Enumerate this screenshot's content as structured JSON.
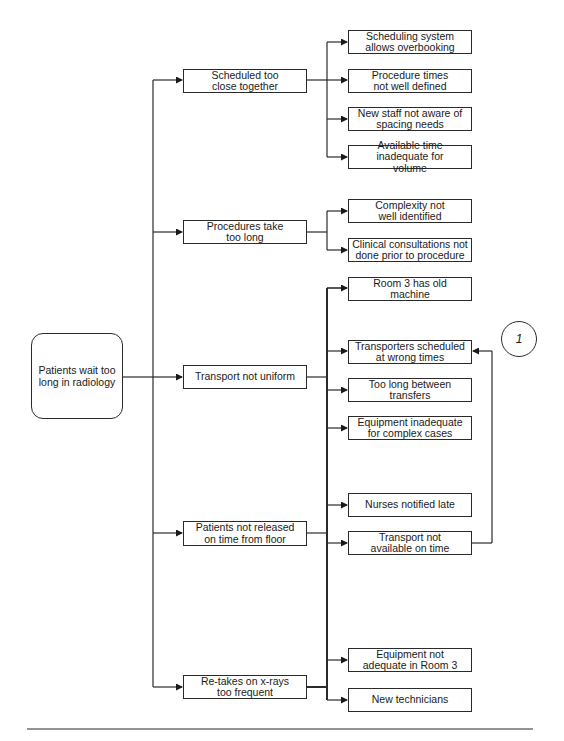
{
  "diagram": {
    "type": "tree-diagram",
    "root": {
      "label": "Patients wait too long in radiology",
      "lines": [
        "Patients wait too",
        "long in radiology"
      ]
    },
    "causes": [
      {
        "id": "c1",
        "lines": [
          "Scheduled too",
          "close together"
        ],
        "subcauses": [
          {
            "lines": [
              "Scheduling system",
              "allows overbooking"
            ]
          },
          {
            "lines": [
              "Procedure times",
              "not well defined"
            ]
          },
          {
            "lines": [
              "New staff not aware",
              "of spacing needs"
            ]
          },
          {
            "lines": [
              "Available time",
              "inadequate for volume"
            ]
          }
        ]
      },
      {
        "id": "c2",
        "lines": [
          "Procedures take",
          "too long"
        ],
        "subcauses": [
          {
            "lines": [
              "Complexity not",
              "well identified"
            ]
          },
          {
            "lines": [
              "Clinical consultations not",
              "done prior to procedure"
            ]
          },
          {
            "lines": [
              "Room 3 has old machine"
            ]
          }
        ]
      },
      {
        "id": "c3",
        "lines": [
          "Transport not uniform"
        ],
        "subcauses": [
          {
            "lines": [
              "Transporters scheduled",
              "at wrong times"
            ]
          },
          {
            "lines": [
              "Too long",
              "between transfers"
            ]
          },
          {
            "lines": [
              "Equipment inadequate",
              "for complex cases"
            ]
          }
        ]
      },
      {
        "id": "c4",
        "lines": [
          "Patients not released",
          "on time from floor"
        ],
        "subcauses": [
          {
            "lines": [
              "Nurses notified late"
            ]
          },
          {
            "lines": [
              "Transport not",
              "available on time"
            ]
          }
        ]
      },
      {
        "id": "c5",
        "lines": [
          "Re-takes on x-rays",
          "too frequent"
        ],
        "subcauses": [
          {
            "lines": [
              "Equipment not",
              "adequate in Room 3"
            ]
          },
          {
            "lines": [
              "New technicians"
            ]
          }
        ]
      }
    ],
    "marker": {
      "label": "1"
    },
    "feedback_link": {
      "from": "Transport not available on time",
      "to": "Transporters scheduled at wrong times"
    }
  },
  "text": {
    "root": "Patients wait too long in radiology",
    "c1": "Scheduled too close together",
    "c1s1": "Scheduling system allows overbooking",
    "c1s2": "Procedure times not well defined",
    "c1s3": "New staff not aware of spacing needs",
    "c1s4": "Available time inadequate for volume",
    "c2": "Procedures take too long",
    "c2s1": "Complexity not well identified",
    "c2s2": "Clinical consultations not done prior to procedure",
    "c2s3": "Room 3 has old machine",
    "c3": "Transport not uniform",
    "c3s1": "Transporters scheduled at wrong times",
    "c3s2": "Too long between transfers",
    "c3s3": "Equipment inadequate for complex cases",
    "c4": "Patients not released on time from floor",
    "c4s1": "Nurses notified late",
    "c4s2": "Transport not available on time",
    "c5": "Re-takes on x-rays too frequent",
    "c5s1": "Equipment not adequate in Room 3",
    "c5s2": "New technicians",
    "marker": "1"
  },
  "colors": {
    "line": "#2a2a2a",
    "background": "#ffffff",
    "text": "#1a1a1a"
  }
}
